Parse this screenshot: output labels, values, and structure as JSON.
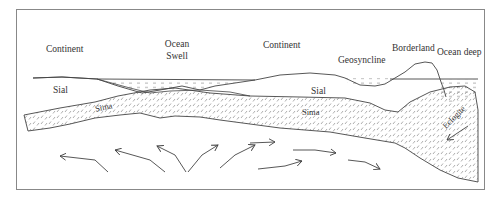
{
  "figure": {
    "type": "geological cross-section",
    "labels": {
      "continent_left": "Continent",
      "ocean_swell_1": "Ocean",
      "ocean_swell_2": "Swell",
      "continent_right": "Continent",
      "geosyncline": "Geosyncline",
      "borderland": "Borderland",
      "ocean_deep": "Ocean deep",
      "sial_left": "Sial",
      "sial_right": "Sial",
      "sima_left": "Sima",
      "sima_right": "Sima",
      "eclogite": "Eclogite"
    },
    "colors": {
      "frame": "#888888",
      "line": "#444444",
      "text": "#333333",
      "hatch": "#777777"
    }
  }
}
